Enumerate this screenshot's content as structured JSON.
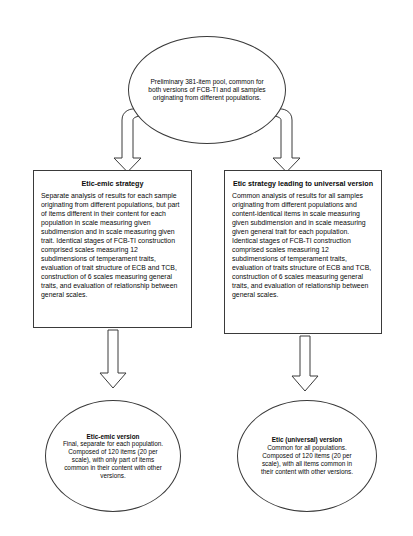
{
  "diagram": {
    "type": "flowchart",
    "title_hidden": true,
    "nodes": {
      "source": {
        "shape": "oval",
        "text": "Preliminary 381-item pool, common for both versions of FCB-TI  and all samples originating from different populations."
      },
      "strategy_left": {
        "shape": "rectangle",
        "title": "Etic-emic strategy",
        "body": "Separate analysis of results for each sample originating from different populations, but part of items different in their content for each population in scale measuring given subdimension and in scale measuring given trait. Identical stages of FCB-TI construction comprised scales measuring 12 subdimensions of temperament traits, evaluation of trait structure of ECB and TCB, construction of 6 scales measuring general traits, and evaluation of relationship between general scales."
      },
      "strategy_right": {
        "shape": "rectangle",
        "title": "Etic strategy leading to universal version",
        "body": "Common analysis of results for all samples originating from different populations and content-identical items in scale measuring given subdimension and in scale measuring given general trait for each population. Identical stages of FCB-TI construction comprised scales measuring 12 subdimensions of temperament traits, evaluation of traits structure of ECB and TCB, construction of 6 scales measuring general traits, and evaluation of relationship between general scales."
      },
      "result_left": {
        "shape": "oval",
        "title": "Etic-emic version",
        "body": "Final, separate for each population. Composed of 120 items (20 per scale), with only part of items common in their content with other versions."
      },
      "result_right": {
        "shape": "oval",
        "title": "Etic (universal) version",
        "body": "Common for all populations. Composed of 120 items (20 per scale), with all items common in their content with other versions."
      }
    },
    "connectors": [
      {
        "name": "source-to-left-strategy",
        "style": "hollow-elbow-block-arrow",
        "direction": "down"
      },
      {
        "name": "source-to-right-strategy",
        "style": "hollow-elbow-block-arrow",
        "direction": "down"
      },
      {
        "name": "left-strategy-to-left-result",
        "style": "hollow-block-arrow",
        "direction": "down"
      },
      {
        "name": "right-strategy-to-right-result",
        "style": "hollow-block-arrow",
        "direction": "down"
      }
    ],
    "colors": {
      "stroke": "#3a3a3a",
      "fill": "#ffffff",
      "text": "#0a0a0a"
    }
  }
}
